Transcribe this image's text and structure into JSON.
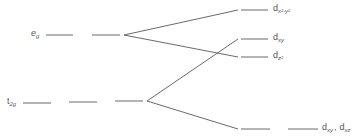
{
  "diagram": {
    "type": "crystal-field-splitting",
    "colors": {
      "line": "#6a6a6a",
      "text": "#555555"
    },
    "left_levels": [
      {
        "id": "eg",
        "label_main": "e",
        "label_sub": "g"
      },
      {
        "id": "t2g",
        "label_main": "t",
        "label_sub": "2g"
      }
    ],
    "right_levels": [
      {
        "id": "dx2y2",
        "label_main": "d",
        "label_sub": "x²-y²"
      },
      {
        "id": "dxy",
        "label_main": "d",
        "label_sub": "xy"
      },
      {
        "id": "dz2",
        "label_main": "d",
        "label_sub": "z²"
      },
      {
        "id": "dxy_dxz",
        "label_main": "d",
        "label_sub": "xy",
        "separator": ",",
        "label2_main": "d",
        "label2_sub": "xz"
      }
    ]
  }
}
